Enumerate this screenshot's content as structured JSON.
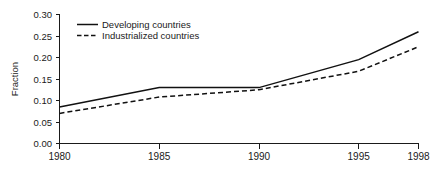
{
  "chart_data": {
    "type": "line",
    "title": "",
    "subtitle": "",
    "xlabel": "",
    "ylabel": "Fraction",
    "x": [
      1980,
      1985,
      1990,
      1995,
      1998
    ],
    "xtick_labels": [
      "1980",
      "1985",
      "1990",
      "1995",
      "1998"
    ],
    "xlim": [
      1980,
      1998
    ],
    "ylim": [
      0.0,
      0.3
    ],
    "ytick_labels": [
      "0.00",
      "0.05",
      "0.10",
      "0.15",
      "0.20",
      "0.25",
      "0.30"
    ],
    "ytick_values": [
      0.0,
      0.05,
      0.1,
      0.15,
      0.2,
      0.25,
      0.3
    ],
    "grid": false,
    "legend_position": "top-left inside axes",
    "legend_frame": false,
    "series": [
      {
        "name": "Developing countries",
        "style": "solid",
        "color": "#111111",
        "values": [
          0.085,
          0.13,
          0.13,
          0.195,
          0.26
        ]
      },
      {
        "name": "Industrialized countries",
        "style": "dashed",
        "color": "#111111",
        "values": [
          0.07,
          0.108,
          0.125,
          0.168,
          0.225
        ]
      }
    ]
  },
  "axes": {
    "y_axis_label": "Fraction"
  },
  "legend": {
    "entries": [
      {
        "label": "Developing countries"
      },
      {
        "label": "Industrialized countries"
      }
    ]
  },
  "ticks": {
    "y": [
      "0.00",
      "0.05",
      "0.10",
      "0.15",
      "0.20",
      "0.25",
      "0.30"
    ],
    "x": [
      "1980",
      "1985",
      "1990",
      "1995",
      "1998"
    ]
  }
}
